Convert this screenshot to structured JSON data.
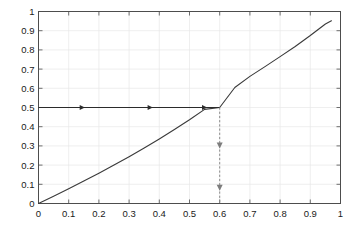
{
  "chart_data": {
    "type": "line",
    "title": "",
    "subtitle": "",
    "xlabel": "",
    "ylabel": "",
    "xlim": [
      0,
      1
    ],
    "ylim": [
      0,
      1
    ],
    "grid": true,
    "legend": "none",
    "xticks": [
      "0",
      "0.1",
      "0.2",
      "0.3",
      "0.4",
      "0.5",
      "0.6",
      "0.7",
      "0.8",
      "0.9",
      "1"
    ],
    "xtick_values": [
      0,
      0.1,
      0.2,
      0.3,
      0.4,
      0.5,
      0.6,
      0.7,
      0.8,
      0.9,
      1
    ],
    "yticks": [
      "0",
      "0.1",
      "0.2",
      "0.3",
      "0.4",
      "0.5",
      "0.6",
      "0.7",
      "0.8",
      "0.9",
      "1"
    ],
    "ytick_values": [
      0,
      0.1,
      0.2,
      0.3,
      0.4,
      0.5,
      0.6,
      0.7,
      0.8,
      0.9,
      1
    ],
    "series": [
      {
        "name": "function-curve",
        "color": "#3a3a3a",
        "style": "solid",
        "x": [
          0.0,
          0.05,
          0.1,
          0.15,
          0.2,
          0.25,
          0.3,
          0.35,
          0.4,
          0.45,
          0.5,
          0.55,
          0.6,
          0.65,
          0.7,
          0.75,
          0.8,
          0.85,
          0.9,
          0.95,
          0.97
        ],
        "y": [
          0.0,
          0.038,
          0.077,
          0.117,
          0.158,
          0.2,
          0.244,
          0.289,
          0.336,
          0.385,
          0.436,
          0.49,
          0.5,
          0.604,
          0.662,
          0.713,
          0.765,
          0.818,
          0.875,
          0.935,
          0.952
        ]
      },
      {
        "name": "horizontal-iteration-path",
        "color": "#2b2b2b",
        "style": "solid",
        "x": [
          0.0,
          0.6
        ],
        "y": [
          0.5,
          0.5
        ],
        "arrow_positions_x": [
          0.145,
          0.37,
          0.55
        ],
        "arrow_direction": "right"
      },
      {
        "name": "vertical-projection-path",
        "color": "#7d7d7d",
        "style": "dashed",
        "x": [
          0.6,
          0.6
        ],
        "y": [
          0.5,
          0.0
        ],
        "arrow_positions_y": [
          0.3,
          0.08
        ],
        "arrow_direction": "down"
      }
    ],
    "annotations": [
      {
        "name": "fixed-point",
        "x": 0.6,
        "y": 0.5
      }
    ]
  },
  "colors": {
    "background": "#ffffff",
    "axis": "#4d4d4d",
    "grid": "#e8e8e8",
    "curve": "#3a3a3a",
    "horizontal_path": "#2b2b2b",
    "vertical_path": "#7d7d7d",
    "tick_text": "#1a1a1a"
  }
}
